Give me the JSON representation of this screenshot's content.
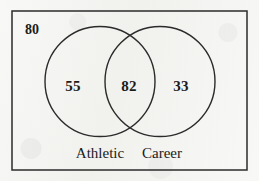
{
  "diagram": {
    "type": "venn2",
    "title": "",
    "universe_outside_count": "80",
    "sets": [
      {
        "name": "Athletic",
        "only_count": "55"
      },
      {
        "name": "Career",
        "only_count": "33"
      }
    ],
    "intersection_count": "82",
    "colors": {
      "stroke": "#2b2b2b",
      "text": "#1b1b1b",
      "background": "#f8f8f6",
      "fill": "none"
    },
    "geometry": {
      "rect": {
        "x": 12,
        "y": 11,
        "width": 235,
        "height": 159
      },
      "left_circle": {
        "cx": 100,
        "cy": 81.5,
        "r": 55
      },
      "right_circle": {
        "cx": 160,
        "cy": 81.5,
        "r": 55
      },
      "stroke_width": 1.4
    },
    "labels": {
      "universe": {
        "x": 25,
        "y": 30
      },
      "left_only": {
        "x": 73,
        "y": 86
      },
      "intersection": {
        "x": 129,
        "y": 86
      },
      "right_only": {
        "x": 181,
        "y": 86
      },
      "left_name": {
        "x": 100,
        "y": 153
      },
      "right_name": {
        "x": 162,
        "y": 153
      }
    }
  },
  "chart_data": {
    "type": "venn",
    "title": "",
    "set_labels": [
      "Athletic",
      "Career"
    ],
    "regions": [
      {
        "id": "Athletic-only",
        "label": "55",
        "value": 55
      },
      {
        "id": "Athletic-and-Career",
        "label": "82",
        "value": 82
      },
      {
        "id": "Career-only",
        "label": "33",
        "value": 33
      },
      {
        "id": "neither",
        "label": "80",
        "value": 80
      }
    ],
    "totals": {
      "Athletic": 137,
      "Career": 115,
      "universe": 250
    },
    "grid": false,
    "legend": "none"
  }
}
